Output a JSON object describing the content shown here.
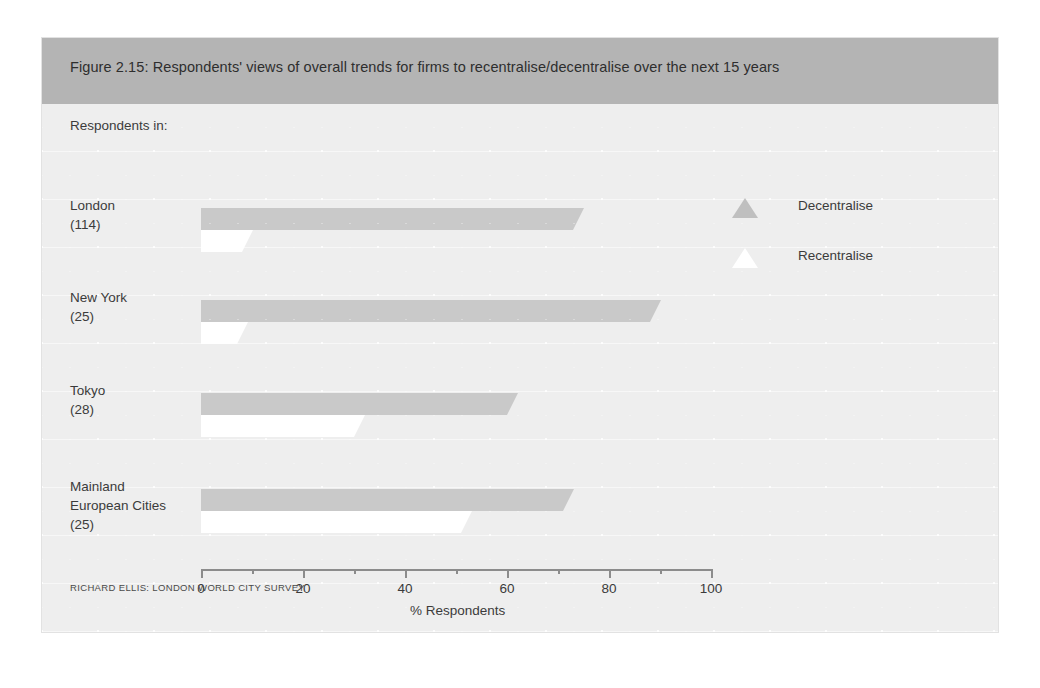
{
  "figure": {
    "title": "Figure 2.15: Respondents' views of overall trends for firms to recentralise/decentralise over the next 15 years",
    "respondents_heading": "Respondents in:",
    "source": "RICHARD ELLIS: LONDON WORLD CITY SURVEY"
  },
  "colors": {
    "title_bar": "#b4b4b4",
    "plot_background": "#eeeeee",
    "decentralise": "#c9c9c9",
    "recentralise": "#ffffff",
    "axis": "#8c8c8c",
    "text": "#3b3b3b"
  },
  "legend": {
    "position": "right",
    "items": [
      {
        "label": "Decentralise",
        "marker": "triangle-up-icon",
        "color": "#bfbfbf"
      },
      {
        "label": "Recentralise",
        "marker": "triangle-up-icon",
        "color": "#ffffff"
      }
    ]
  },
  "categories_meta": [
    {
      "name": "London",
      "line1": "London",
      "line2": "European Cities",
      "count_label": "(114)",
      "two_line_name": false
    },
    {
      "name": "New York",
      "line1": "New York",
      "line2": "",
      "count_label": "(25)",
      "two_line_name": false
    },
    {
      "name": "Tokyo",
      "line1": "Tokyo",
      "line2": "",
      "count_label": "(28)",
      "two_line_name": false
    },
    {
      "name": "Mainland European Cities",
      "line1": "Mainland",
      "line2": "European Cities",
      "count_label": "(25)",
      "two_line_name": true
    }
  ],
  "chart_data": {
    "type": "bar",
    "orientation": "horizontal",
    "title": "Figure 2.15: Respondents' views of overall trends for firms to recentralise/decentralise over the next 15 years",
    "subtitle": "Respondents in:",
    "xlabel": "% Respondents",
    "ylabel": "",
    "xlim": [
      0,
      100
    ],
    "xticks": [
      0,
      20,
      40,
      60,
      80,
      100
    ],
    "xtick_labels": [
      "0",
      "20",
      "40",
      "60",
      "80",
      "100"
    ],
    "minor_tick_step": 10,
    "grid": false,
    "legend_position": "right",
    "categories": [
      "London",
      "New York",
      "Tokyo",
      "Mainland European Cities"
    ],
    "category_counts": [
      "(114)",
      "(25)",
      "(28)",
      "(25)"
    ],
    "series": [
      {
        "name": "Decentralise",
        "color": "#c9c9c9",
        "values": [
          73,
          88,
          60,
          71
        ]
      },
      {
        "name": "Recentralise",
        "color": "#ffffff",
        "values": [
          8,
          7,
          30,
          51
        ]
      }
    ],
    "source": "RICHARD ELLIS: LONDON WORLD CITY SURVEY"
  }
}
